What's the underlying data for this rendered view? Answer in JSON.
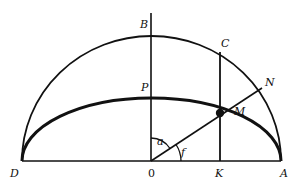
{
  "diagram": {
    "type": "geometry",
    "colors": {
      "stroke": "#111111",
      "background": "#ffffff"
    },
    "points": {
      "B": {
        "label": "B",
        "x": 151,
        "y": 36
      },
      "P": {
        "label": "P",
        "x": 151,
        "y": 98
      },
      "C": {
        "label": "C",
        "x": 220,
        "y": 53
      },
      "N": {
        "label": "N",
        "x": 262,
        "y": 88
      },
      "M": {
        "label": "M",
        "x": 220,
        "y": 112
      },
      "D": {
        "label": "D",
        "x": 22,
        "y": 161
      },
      "O": {
        "label": "0",
        "x": 151,
        "y": 161
      },
      "K": {
        "label": "K",
        "x": 220,
        "y": 161
      },
      "A": {
        "label": "A",
        "x": 281,
        "y": 161
      }
    },
    "angles": {
      "a": {
        "label": "a",
        "between": [
          "OB",
          "OM"
        ]
      },
      "f": {
        "label": "f",
        "between": [
          "OA",
          "OM"
        ]
      }
    }
  }
}
